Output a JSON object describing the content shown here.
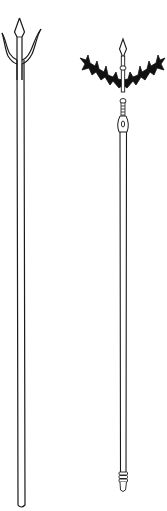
{
  "figure": {
    "description": "Line drawing of two polearms",
    "items": [
      {
        "name": "trident",
        "parts": [
          "central spear point",
          "two curved side prongs",
          "long double-line shaft",
          "rounded butt"
        ]
      },
      {
        "name": "spiked-crescent polearm",
        "parts": [
          "small spear point",
          "black spiked crescent blade",
          "ring collar",
          "ringed socket with loop",
          "long shaft",
          "banded butt cap"
        ]
      }
    ],
    "colors": {
      "line": "#1a1a1a",
      "background": "#ffffff",
      "fill": "#111111"
    }
  }
}
